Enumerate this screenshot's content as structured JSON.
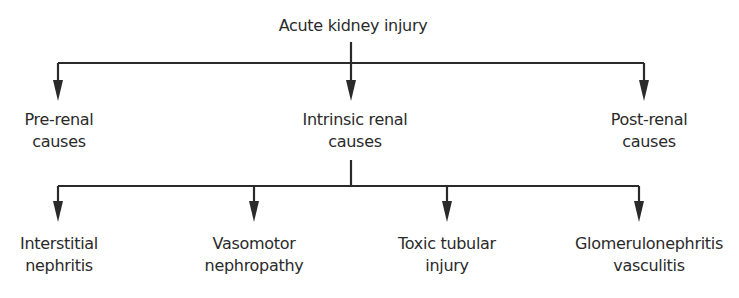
{
  "diagram": {
    "type": "tree",
    "root": {
      "label": "Acute kidney injury"
    },
    "level1": [
      {
        "line1": "Pre-renal",
        "line2": "causes"
      },
      {
        "line1": "Intrinsic renal",
        "line2": "causes"
      },
      {
        "line1": "Post-renal",
        "line2": "causes"
      }
    ],
    "level2_parent": "Intrinsic renal causes",
    "level2": [
      {
        "line1": "Interstitial",
        "line2": "nephritis"
      },
      {
        "line1": "Vasomotor",
        "line2": "nephropathy"
      },
      {
        "line1": "Toxic tubular",
        "line2": "injury"
      },
      {
        "line1": "Glomerulonephritis",
        "line2": "vasculitis"
      }
    ],
    "colors": {
      "line": "#2a2a2a",
      "text": "#2a2a2a",
      "background": "#ffffff"
    }
  }
}
